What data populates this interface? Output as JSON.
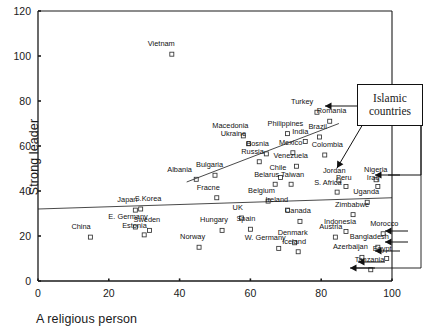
{
  "chart_data": {
    "type": "scatter",
    "title": "",
    "xlabel": "A religious person",
    "ylabel": "Strong leader",
    "xlim": [
      0,
      100
    ],
    "ylim": [
      0,
      120
    ],
    "xticks": [
      0,
      20,
      40,
      60,
      80,
      100
    ],
    "yticks": [
      0,
      20,
      40,
      60,
      80,
      100,
      120
    ],
    "grid": false,
    "legend": null,
    "marker": "open-square",
    "annotations": [
      {
        "text": "Islamic countries",
        "lines": [
          "Islamic",
          "countries"
        ],
        "points_to": [
          "Turkey",
          "Iraq",
          "Jordan",
          "Morocco",
          "Indonesia",
          "Bangladesh",
          "Egypt",
          "Azerbaijan"
        ]
      }
    ],
    "trendlines": [
      {
        "name": "upper-fit",
        "x": [
          42,
          85
        ],
        "y": [
          44,
          70
        ]
      },
      {
        "name": "lower-fit",
        "x": [
          0,
          100
        ],
        "y": [
          32,
          37
        ]
      }
    ],
    "points": [
      {
        "label": "Vietnam",
        "x": 37.8,
        "y": 100.8,
        "lx": -24,
        "ly": -9
      },
      {
        "label": "Turkey",
        "x": 78.8,
        "y": 75.0,
        "lx": -26,
        "ly": -9
      },
      {
        "label": "Romania",
        "x": 82.4,
        "y": 71.0,
        "lx": -13,
        "ly": -9
      },
      {
        "label": "Macedonia",
        "x": 58.0,
        "y": 64.5,
        "lx": -31,
        "ly": -9
      },
      {
        "label": "Philippines",
        "x": 70.5,
        "y": 65.5,
        "lx": -20,
        "ly": -9
      },
      {
        "label": "Brazil",
        "x": 79.5,
        "y": 64.0,
        "lx": -11,
        "ly": -9
      },
      {
        "label": "Ukraine",
        "x": 59.5,
        "y": 61.0,
        "lx": -28,
        "ly": -9
      },
      {
        "label": "India",
        "x": 75.5,
        "y": 62.0,
        "lx": -13,
        "ly": -9
      },
      {
        "label": "Bosnia",
        "x": 64.5,
        "y": 56.5,
        "lx": -20,
        "ly": -9
      },
      {
        "label": "Mexico",
        "x": 72.0,
        "y": 57.0,
        "lx": -14,
        "ly": -9
      },
      {
        "label": "Colombia",
        "x": 81.0,
        "y": 56.0,
        "lx": -13,
        "ly": -9
      },
      {
        "label": "Russia",
        "x": 62.5,
        "y": 53.0,
        "lx": -18,
        "ly": -9
      },
      {
        "label": "Venezuela",
        "x": 73.0,
        "y": 51.0,
        "lx": -23,
        "ly": -9
      },
      {
        "label": "Bulgaria",
        "x": 50.0,
        "y": 47.0,
        "lx": -19,
        "ly": -9
      },
      {
        "label": "Albania",
        "x": 44.7,
        "y": 45.2,
        "lx": -29,
        "ly": -8
      },
      {
        "label": "Chile",
        "x": 68.5,
        "y": 46.0,
        "lx": -11,
        "ly": -9
      },
      {
        "label": "Belarus",
        "x": 67.0,
        "y": 43.0,
        "lx": -21,
        "ly": -8
      },
      {
        "label": "Taiwan",
        "x": 71.5,
        "y": 43.0,
        "lx": -10,
        "ly": -8
      },
      {
        "label": "Jordan",
        "x": 85.0,
        "y": 44.5,
        "lx": -16,
        "ly": -9
      },
      {
        "label": "Peru",
        "x": 87.0,
        "y": 42.0,
        "lx": -10,
        "ly": -8
      },
      {
        "label": "S. Africa",
        "x": 84.5,
        "y": 39.5,
        "lx": -23,
        "ly": -8
      },
      {
        "label": "Nigeria",
        "x": 95.5,
        "y": 45.0,
        "lx": -12,
        "ly": -9
      },
      {
        "label": "Iraq",
        "x": 96.0,
        "y": 42.0,
        "lx": -11,
        "ly": -8
      },
      {
        "label": "Fracne",
        "x": 50.5,
        "y": 37.0,
        "lx": -20,
        "ly": -9
      },
      {
        "label": "Belgium",
        "x": 65.0,
        "y": 35.5,
        "lx": -20,
        "ly": -9
      },
      {
        "label": "Uganda",
        "x": 93.0,
        "y": 35.0,
        "lx": -14,
        "ly": -9
      },
      {
        "label": "Japan",
        "x": 27.5,
        "y": 31.5,
        "lx": -18,
        "ly": -9
      },
      {
        "label": "S.Korea",
        "x": 29.0,
        "y": 32.0,
        "lx": -6,
        "ly": -9
      },
      {
        "label": "Ireland",
        "x": 70.5,
        "y": 31.5,
        "lx": -22,
        "ly": -9
      },
      {
        "label": "Zimbabwe",
        "x": 89.0,
        "y": 29.5,
        "lx": -18,
        "ly": -9
      },
      {
        "label": "E. Germany",
        "x": 27.5,
        "y": 24.0,
        "lx": -27,
        "ly": -9
      },
      {
        "label": "UK",
        "x": 57.5,
        "y": 28.0,
        "lx": -9,
        "ly": -9
      },
      {
        "label": "Canada",
        "x": 74.0,
        "y": 26.5,
        "lx": -15,
        "ly": -9
      },
      {
        "label": "Sweden",
        "x": 31.5,
        "y": 22.5,
        "lx": -16,
        "ly": -9
      },
      {
        "label": "Estonia",
        "x": 30.0,
        "y": 20.5,
        "lx": -22,
        "ly": -8
      },
      {
        "label": "Hungary",
        "x": 52.0,
        "y": 22.5,
        "lx": -22,
        "ly": -9
      },
      {
        "label": "Spain",
        "x": 60.0,
        "y": 23.0,
        "lx": -14,
        "ly": -9
      },
      {
        "label": "Indonesia",
        "x": 87.0,
        "y": 22.0,
        "lx": -22,
        "ly": -9
      },
      {
        "label": "Morocco",
        "x": 97.5,
        "y": 21.0,
        "lx": -13,
        "ly": -9
      },
      {
        "label": "China",
        "x": 14.8,
        "y": 19.5,
        "lx": -19,
        "ly": -9
      },
      {
        "label": "Austria",
        "x": 84.0,
        "y": 19.5,
        "lx": -16,
        "ly": -9
      },
      {
        "label": "Norway",
        "x": 45.5,
        "y": 15.0,
        "lx": -19,
        "ly": -9
      },
      {
        "label": "W. Germany",
        "x": 68.0,
        "y": 14.5,
        "lx": -34,
        "ly": -9
      },
      {
        "label": "Denmark",
        "x": 72.5,
        "y": 17.0,
        "lx": -17,
        "ly": -9
      },
      {
        "label": "Iceland",
        "x": 73.5,
        "y": 13.0,
        "lx": -16,
        "ly": -9
      },
      {
        "label": "Bangladesh",
        "x": 96.0,
        "y": 15.0,
        "lx": -28,
        "ly": -9
      },
      {
        "label": "Azerbaijan",
        "x": 91.5,
        "y": 10.5,
        "lx": -29,
        "ly": -9
      },
      {
        "label": "Egypt",
        "x": 98.5,
        "y": 10.0,
        "lx": -14,
        "ly": -9
      },
      {
        "label": "Tanzania",
        "x": 94.0,
        "y": 5.0,
        "lx": -16,
        "ly": -9
      }
    ]
  },
  "axes": {
    "x_tick_labels": [
      "0",
      "20",
      "40",
      "60",
      "80",
      "100"
    ],
    "y_tick_labels": [
      "0",
      "20",
      "40",
      "60",
      "80",
      "100",
      "120"
    ],
    "x_title": "A religious person",
    "y_title": "Strong leader"
  },
  "callout": {
    "line1": "Islamic",
    "line2": "countries"
  },
  "colors": {
    "axis": "#1a1a1a",
    "marker_stroke": "#333333",
    "background": "#ffffff",
    "text": "#111111"
  }
}
